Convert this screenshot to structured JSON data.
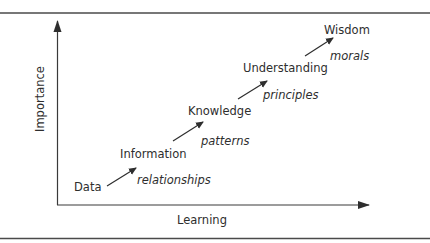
{
  "diagram": {
    "type": "DIKW hierarchy",
    "y_axis_label": "Importance",
    "x_axis_label": "Learning",
    "levels": [
      {
        "label": "Data"
      },
      {
        "label": "Information"
      },
      {
        "label": "Knowledge"
      },
      {
        "label": "Understanding"
      },
      {
        "label": "Wisdom"
      }
    ],
    "transitions": [
      {
        "label": "relationships"
      },
      {
        "label": "patterns"
      },
      {
        "label": "principles"
      },
      {
        "label": "morals"
      }
    ],
    "colors": {
      "line": "#3a3a3a",
      "text": "#2e2e2e",
      "background": "#ffffff"
    }
  }
}
